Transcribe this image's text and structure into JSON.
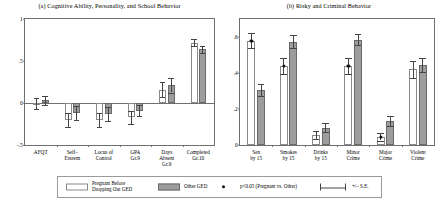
{
  "chart_data": [
    {
      "type": "bar",
      "panel": "a",
      "title": "(a) Cognitive Ability, Personality, and School Behavior",
      "xlabel": "",
      "ylabel": "",
      "ylim": [
        -0.5,
        1.0
      ],
      "yticks": [
        -0.5,
        0,
        0.5,
        1
      ],
      "ytick_labels": [
        "-.5",
        "0",
        ".5",
        "1"
      ],
      "grid": false,
      "legend_position": "bottom",
      "categories": [
        "AFQT",
        "Self–\nEsteem",
        "Locus of\nControl",
        "GPA\nGr.9",
        "Days\nAbsent\nGr.9",
        "Completed\nGr.10"
      ],
      "series": [
        {
          "name": "Pregnant Before Dropping Out GED",
          "color": "#ffffff",
          "values": [
            -0.01,
            -0.2,
            -0.2,
            -0.17,
            0.16,
            0.72
          ],
          "se": [
            0.065,
            0.085,
            0.085,
            0.075,
            0.085,
            0.045
          ],
          "significant": [
            false,
            false,
            false,
            false,
            false,
            false
          ]
        },
        {
          "name": "Other GED",
          "color": "#9d9d9d",
          "values": [
            0.03,
            -0.12,
            -0.13,
            -0.09,
            0.21,
            0.64
          ],
          "se": [
            0.05,
            0.08,
            0.08,
            0.065,
            0.085,
            0.04
          ],
          "significant": [
            false,
            false,
            false,
            false,
            false,
            false
          ]
        }
      ]
    },
    {
      "type": "bar",
      "panel": "b",
      "title": "(b) Risky and Criminal Behavior",
      "xlabel": "",
      "ylabel": "",
      "ylim": [
        0,
        0.7
      ],
      "yticks": [
        0,
        0.2,
        0.4,
        0.6
      ],
      "ytick_labels": [
        "0",
        ".2",
        ".4",
        ".6"
      ],
      "grid": false,
      "legend_position": "bottom",
      "categories": [
        "Sex\nby 15",
        "Smokes\nby 15",
        "Drinks\nby 15",
        "Minor\nCrime",
        "Major\nCrime",
        "Violent\nCrime"
      ],
      "series": [
        {
          "name": "Pregnant Before Dropping Out GED",
          "color": "#ffffff",
          "values": [
            0.58,
            0.44,
            0.055,
            0.44,
            0.045,
            0.42
          ],
          "se": [
            0.042,
            0.045,
            0.022,
            0.045,
            0.02,
            0.048
          ],
          "significant": [
            true,
            true,
            false,
            true,
            true,
            false
          ]
        },
        {
          "name": "Other GED",
          "color": "#9d9d9d",
          "values": [
            0.305,
            0.575,
            0.095,
            0.585,
            0.135,
            0.445
          ],
          "se": [
            0.035,
            0.035,
            0.025,
            0.032,
            0.028,
            0.038
          ],
          "significant": [
            false,
            false,
            false,
            false,
            false,
            false
          ]
        }
      ]
    }
  ],
  "legend": {
    "pregnant_label": "Pregnant Before\nDropping Out GED",
    "other_label": "Other GED",
    "significance_label": "p<0.05 (Pregnant vs. Other)",
    "se_label": "+/– S.E."
  }
}
